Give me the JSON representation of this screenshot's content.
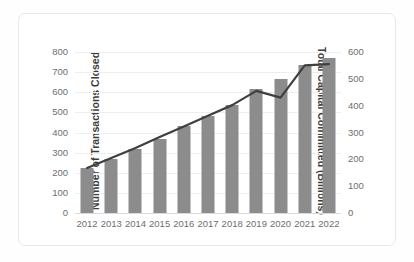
{
  "chart_data": {
    "type": "bar",
    "title": "",
    "subtitle": "",
    "xlabel": "",
    "ylabel": "Number of Transactions Closed",
    "y2label": "Total Capital Committed (Billions)",
    "categories": [
      "2012",
      "2013",
      "2014",
      "2015",
      "2016",
      "2017",
      "2018",
      "2019",
      "2020",
      "2021",
      "2022"
    ],
    "series": [
      {
        "name": "Number of Transactions Closed",
        "type": "bar",
        "axis": "left",
        "color": "#8c8c8c",
        "values": [
          222,
          268,
          318,
          370,
          432,
          482,
          538,
          615,
          668,
          735,
          768
        ]
      },
      {
        "name": "Total Capital Committed (Billions)",
        "type": "line",
        "axis": "right",
        "color": "#3f3f3f",
        "values": [
          168,
          205,
          242,
          283,
          322,
          362,
          402,
          455,
          430,
          550,
          555
        ]
      }
    ],
    "ylim": [
      0,
      800
    ],
    "y2lim": [
      0,
      600
    ],
    "yticks": [
      0,
      100,
      200,
      300,
      400,
      500,
      600,
      700,
      800
    ],
    "y2ticks": [
      0,
      100,
      200,
      300,
      400,
      500,
      600
    ],
    "ytick_labels": [
      "0",
      "100",
      "200",
      "300",
      "400",
      "500",
      "600",
      "700",
      "800"
    ],
    "y2tick_labels": [
      "0",
      "100",
      "200",
      "300",
      "400",
      "500",
      "600"
    ],
    "grid": true,
    "legend": false,
    "legend_position": "none"
  },
  "colors": {
    "bar": "#8c8c8c",
    "line": "#3f3f3f",
    "grid": "#eceff1",
    "axis_text": "#6e6e6e",
    "title_text": "#3d3d3d",
    "frame_border": "#e9e9e9",
    "background": "#ffffff"
  }
}
